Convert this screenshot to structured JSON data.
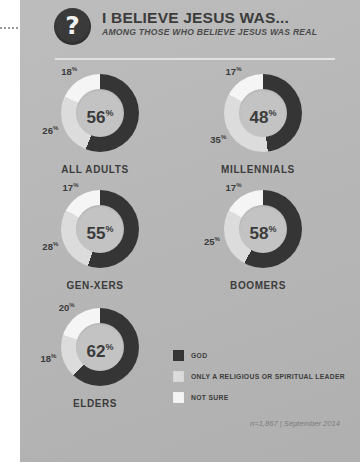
{
  "header": {
    "badge_icon": "question-mark-icon",
    "badge_glyph": "?",
    "title": "I BELIEVE JESUS WAS...",
    "subtitle": "AMONG THOSE WHO BELIEVE JESUS WAS REAL"
  },
  "colors": {
    "background": "#b9b9b9",
    "god": "#353535",
    "leader": "#dcdcdc",
    "not_sure": "#f5f5f5",
    "hole": "#c3c3c3",
    "text": "#3c3c3c"
  },
  "legend": {
    "items": [
      {
        "label": "GOD",
        "color": "#353535",
        "key": "god"
      },
      {
        "label": "ONLY A RELIGIOUS OR SPIRITUAL LEADER",
        "color": "#dcdcdc",
        "key": "leader"
      },
      {
        "label": "NOT SURE",
        "color": "#f5f5f5",
        "key": "not_sure"
      }
    ]
  },
  "footnote": "n=1,867 | September 2014",
  "chart_data": {
    "type": "pie",
    "title": "I BELIEVE JESUS WAS...",
    "subtitle": "AMONG THOSE WHO BELIEVE JESUS WAS REAL",
    "note": "n=1,867 | September 2014",
    "unit": "%",
    "legend_position": "bottom-right",
    "series": [
      {
        "name": "GOD",
        "color": "#353535"
      },
      {
        "name": "ONLY A RELIGIOUS OR SPIRITUAL LEADER",
        "color": "#dcdcdc"
      },
      {
        "name": "NOT SURE",
        "color": "#f5f5f5"
      }
    ],
    "categories": [
      "ALL ADULTS",
      "MILLENNIALS",
      "GEN-XERS",
      "BOOMERS",
      "ELDERS"
    ],
    "charts": [
      {
        "category": "ALL ADULTS",
        "center_value": "56",
        "center_suffix": "%",
        "slices": [
          {
            "key": "god",
            "label": "56",
            "suffix": "%",
            "value": 56
          },
          {
            "key": "leader",
            "label": "26",
            "suffix": "%",
            "value": 26
          },
          {
            "key": "not_sure",
            "label": "18",
            "suffix": "%",
            "value": 18
          }
        ]
      },
      {
        "category": "MILLENNIALS",
        "center_value": "48",
        "center_suffix": "%",
        "slices": [
          {
            "key": "god",
            "label": "48",
            "suffix": "%",
            "value": 48
          },
          {
            "key": "leader",
            "label": "35",
            "suffix": "%",
            "value": 35
          },
          {
            "key": "not_sure",
            "label": "17",
            "suffix": "%",
            "value": 17
          }
        ]
      },
      {
        "category": "GEN-XERS",
        "center_value": "55",
        "center_suffix": "%",
        "slices": [
          {
            "key": "god",
            "label": "55",
            "suffix": "%",
            "value": 55
          },
          {
            "key": "leader",
            "label": "28",
            "suffix": "%",
            "value": 28
          },
          {
            "key": "not_sure",
            "label": "17",
            "suffix": "%",
            "value": 17
          }
        ]
      },
      {
        "category": "BOOMERS",
        "center_value": "58",
        "center_suffix": "%",
        "slices": [
          {
            "key": "god",
            "label": "58",
            "suffix": "%",
            "value": 58
          },
          {
            "key": "leader",
            "label": "25",
            "suffix": "%",
            "value": 25
          },
          {
            "key": "not_sure",
            "label": "17",
            "suffix": "%",
            "value": 17
          }
        ]
      },
      {
        "category": "ELDERS",
        "center_value": "62",
        "center_suffix": "%",
        "slices": [
          {
            "key": "god",
            "label": "62",
            "suffix": "%",
            "value": 62
          },
          {
            "key": "leader",
            "label": "18",
            "suffix": "%",
            "value": 18
          },
          {
            "key": "not_sure",
            "label": "20",
            "suffix": "%",
            "value": 20
          }
        ]
      }
    ]
  },
  "layout": {
    "cells": [
      {
        "left": 0,
        "top": 74
      },
      {
        "left": 163,
        "top": 74
      },
      {
        "left": 0,
        "top": 190
      },
      {
        "left": 163,
        "top": 190
      },
      {
        "left": 0,
        "top": 308
      }
    ]
  }
}
